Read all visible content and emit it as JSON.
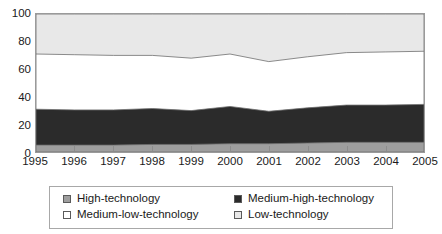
{
  "chart_data": {
    "type": "area",
    "title": "",
    "subtitle": "",
    "xlabel": "",
    "ylabel": "",
    "stacked": true,
    "grid": false,
    "legend_position": "bottom",
    "xlim": [
      1995,
      2005
    ],
    "ylim": [
      0,
      100
    ],
    "yticks": [
      0,
      20,
      40,
      60,
      80,
      100
    ],
    "x": [
      1995,
      1996,
      1997,
      1998,
      1999,
      2000,
      2001,
      2002,
      2003,
      2004,
      2005
    ],
    "xtick_labels": [
      "1995",
      "1996",
      "1997",
      "1998",
      "1999",
      "2000",
      "2001",
      "2002",
      "2003",
      "2004",
      "2005"
    ],
    "series": [
      {
        "name": "High-technology",
        "color": "#9e9e9e",
        "values": [
          5,
          5,
          5,
          5.5,
          5.5,
          6,
          6,
          6.5,
          7,
          7,
          7
        ]
      },
      {
        "name": "Medium-high-technology",
        "color": "#2b2b2b",
        "values": [
          26,
          25.5,
          25.5,
          26,
          24.5,
          27,
          23.5,
          25.5,
          27,
          27,
          27.5
        ]
      },
      {
        "name": "Medium-low-technology",
        "color": "#ffffff",
        "values": [
          40,
          40,
          39.5,
          38.5,
          38,
          38,
          36,
          37,
          38,
          38.5,
          38.5
        ]
      },
      {
        "name": "Low-technology",
        "color": "#e8e8e8",
        "values": [
          29,
          29.5,
          30,
          30,
          32,
          29,
          34.5,
          31,
          28,
          27.5,
          27
        ]
      }
    ],
    "cumulative_upper_bounds": {
      "high_technology": [
        5,
        5,
        5,
        5.5,
        5.5,
        6,
        6,
        6.5,
        7,
        7,
        7
      ],
      "medium_high_technology": [
        31,
        30.5,
        30.5,
        31.5,
        30,
        33,
        29.5,
        32,
        34,
        34,
        34.5
      ],
      "medium_low_technology": [
        71,
        70.5,
        70,
        70,
        68,
        71,
        65.5,
        69,
        72,
        72.5,
        73
      ],
      "low_technology": [
        100,
        100,
        100,
        100,
        100,
        100,
        100,
        100,
        100,
        100,
        100
      ]
    }
  },
  "legend": {
    "items": [
      {
        "label": "High-technology",
        "swatch": "#9e9e9e"
      },
      {
        "label": "Medium-high-technology",
        "swatch": "#2b2b2b"
      },
      {
        "label": "Medium-low-technology",
        "swatch": "#ffffff"
      },
      {
        "label": "Low-technology",
        "swatch": "#e8e8e8"
      }
    ]
  }
}
